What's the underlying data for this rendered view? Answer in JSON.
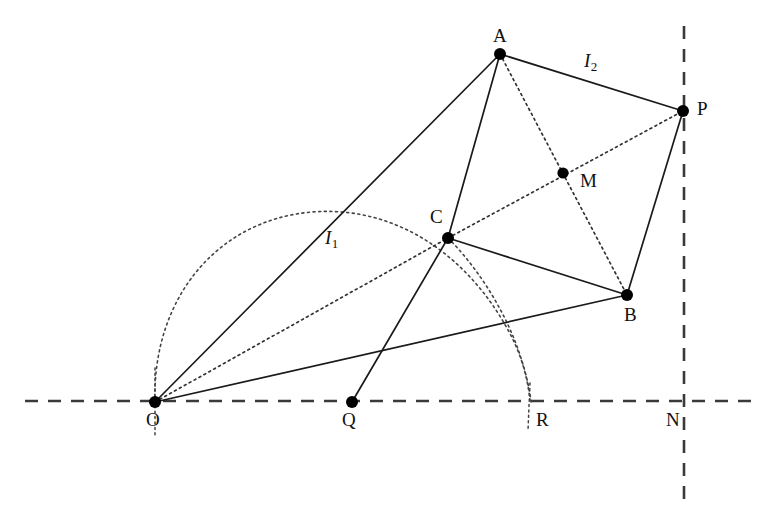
{
  "figure": {
    "width": 767,
    "height": 529,
    "background_color": "#ffffff",
    "stroke_color": "#1a1a1a",
    "axis_color": "#3a3a3a"
  },
  "points": [
    {
      "id": "A",
      "label": "A",
      "x": 500,
      "y": 54,
      "label_x": 493,
      "label_y": 26,
      "marker": "filled-dot"
    },
    {
      "id": "P",
      "label": "P",
      "x": 683,
      "y": 111,
      "label_x": 697,
      "label_y": 99,
      "marker": "filled-dot"
    },
    {
      "id": "M",
      "label": "M",
      "x": 563,
      "y": 173,
      "label_x": 580,
      "label_y": 171,
      "marker": "filled-dot"
    },
    {
      "id": "C",
      "label": "C",
      "x": 448,
      "y": 238,
      "label_x": 430,
      "label_y": 207,
      "marker": "filled-dot"
    },
    {
      "id": "B",
      "label": "B",
      "x": 627,
      "y": 295,
      "label_x": 624,
      "label_y": 305,
      "marker": "filled-dot"
    },
    {
      "id": "O",
      "label": "O",
      "x": 155,
      "y": 402,
      "label_x": 146,
      "label_y": 410,
      "marker": "filled-dot"
    },
    {
      "id": "Q",
      "label": "Q",
      "x": 352,
      "y": 402,
      "label_x": 342,
      "label_y": 410,
      "marker": "filled-dot"
    },
    {
      "id": "R",
      "label": "R",
      "x": 530,
      "y": 401,
      "label_x": 536,
      "label_y": 410,
      "marker": "none"
    },
    {
      "id": "N",
      "label": "N",
      "x": 684,
      "y": 401,
      "label_x": 666,
      "label_y": 410,
      "marker": "none"
    }
  ],
  "segment_labels": [
    {
      "id": "I1",
      "base": "I",
      "sub": "1",
      "x": 325,
      "y": 228,
      "describes": "segment O-A"
    },
    {
      "id": "I2",
      "base": "I",
      "sub": "2",
      "x": 584,
      "y": 51,
      "describes": "segment A-P"
    }
  ],
  "solid_segments": [
    {
      "id": "O-A",
      "from": "O",
      "to": "A"
    },
    {
      "id": "O-B",
      "from": "O",
      "to": "B"
    },
    {
      "id": "A-C",
      "from": "A",
      "to": "C"
    },
    {
      "id": "A-P",
      "from": "A",
      "to": "P"
    },
    {
      "id": "C-B",
      "from": "C",
      "to": "B"
    },
    {
      "id": "P-B",
      "from": "P",
      "to": "B"
    },
    {
      "id": "Q-C",
      "from": "Q",
      "to": "C"
    }
  ],
  "dotted_segments": [
    {
      "id": "O-C",
      "from": "O",
      "to": "C"
    },
    {
      "id": "A-M-B",
      "from": "A",
      "to": "B",
      "through": "M"
    },
    {
      "id": "C-M-P",
      "from": "C",
      "to": "P",
      "through": "M"
    }
  ],
  "dotted_arcs": [
    {
      "id": "arc-O-C-R",
      "from": "O",
      "through": "C",
      "to": "R",
      "note": "large arc from O over the top through C down to R"
    },
    {
      "id": "arc-inner-C-R",
      "from": "C",
      "to": "R",
      "note": "inner arc from C down to R"
    }
  ],
  "dotted_verticals": [
    {
      "id": "vertical-at-O",
      "x": 155,
      "y1": 368,
      "y2": 436
    },
    {
      "id": "vertical-at-R",
      "x": 530,
      "y1": 383,
      "y2": 430
    }
  ],
  "dashed_axes": [
    {
      "id": "horizontal-axis",
      "orientation": "horizontal",
      "x1": 25,
      "x2": 752,
      "y": 401
    },
    {
      "id": "vertical-axis",
      "orientation": "vertical",
      "x": 684,
      "y1": 26,
      "y2": 503
    }
  ]
}
